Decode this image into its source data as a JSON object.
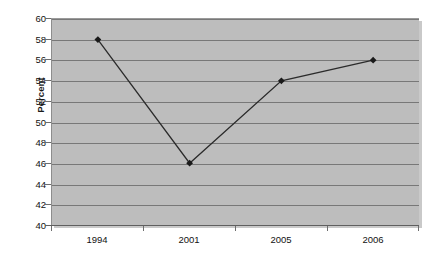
{
  "chart_data": {
    "type": "line",
    "title": "",
    "xlabel": "",
    "ylabel": "Percent",
    "categories": [
      "1994",
      "2001",
      "2005",
      "2006"
    ],
    "values": [
      58,
      46,
      54,
      56
    ],
    "series": [
      {
        "name": "Percent",
        "values": [
          58,
          46,
          54,
          56
        ]
      }
    ],
    "ylim": [
      40,
      60
    ],
    "ytick_step": 2,
    "yticks": [
      40,
      42,
      44,
      46,
      48,
      50,
      52,
      54,
      56,
      58,
      60
    ],
    "ytick_labels": [
      "40",
      "42",
      "44",
      "46",
      "48",
      "50",
      "52",
      "54",
      "56",
      "58",
      "60"
    ],
    "grid": true,
    "grid_axis": "y",
    "legend": false,
    "legend_position": "none",
    "marker": "diamond",
    "colors": {
      "plot_background": "#bdbdbd",
      "figure_background": "#ffffff",
      "gridline": "#787878",
      "series_line": "#2b2b2b",
      "marker_fill": "#1a1a1a",
      "axis_line": "#5f5f5f",
      "tick_label": "#121212"
    }
  }
}
